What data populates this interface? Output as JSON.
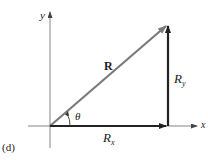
{
  "figure": {
    "panel_label": "(d)",
    "axes": {
      "x_label": "x",
      "y_label": "y"
    },
    "vectors": {
      "resultant": {
        "label": "R",
        "color": "#8a8a8a"
      },
      "x_component": {
        "label_base": "R",
        "label_sub": "x",
        "color": "#222222"
      },
      "y_component": {
        "label_base": "R",
        "label_sub": "y",
        "color": "#222222"
      }
    },
    "angle": {
      "label": "θ"
    }
  }
}
